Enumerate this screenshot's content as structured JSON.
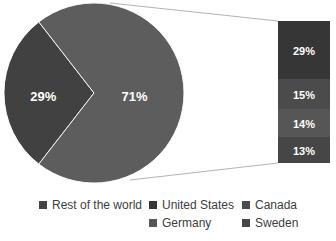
{
  "background": "#ffffff",
  "chart_data": {
    "type": "pie",
    "subtype": "bar-of-pie",
    "title": "",
    "legend_position": "bottom",
    "pie": {
      "slices": [
        {
          "value": 29,
          "display": "29%",
          "color": "#414141"
        },
        {
          "value": 71,
          "display": "71%",
          "color": "#5d5d5d"
        }
      ]
    },
    "bar": {
      "segments": [
        {
          "label": "United States",
          "value": 29,
          "display": "29%",
          "color": "#363636"
        },
        {
          "label": "Canada",
          "value": 15,
          "display": "15%",
          "color": "#4b4b4b"
        },
        {
          "label": "Germany",
          "value": 14,
          "display": "14%",
          "color": "#565656"
        },
        {
          "label": "Sweden",
          "value": 13,
          "display": "13%",
          "color": "#464646"
        }
      ]
    },
    "legend": [
      {
        "label": "Rest of the world",
        "color": "#414141"
      },
      {
        "label": "United States",
        "color": "#363636"
      },
      {
        "label": "Canada",
        "color": "#4b4b4b"
      },
      {
        "label": "Germany",
        "color": "#565656"
      },
      {
        "label": "Sweden",
        "color": "#464646"
      }
    ],
    "connector_color": "#b3b3b3"
  }
}
